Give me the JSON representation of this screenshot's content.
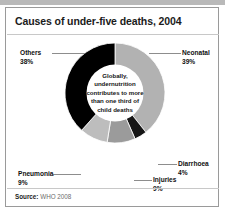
{
  "figure": {
    "title": "Causes of under-five deaths, 2004",
    "center_note": "Globally, undernutrition contributes to more than one third of child deaths",
    "source_label": "Source:",
    "source_value": "WHO 2008"
  },
  "labels": {
    "others": {
      "name": "Others",
      "pct": "38%"
    },
    "neonatal": {
      "name": "Neonatal",
      "pct": "39%"
    },
    "diarrhoea": {
      "name": "Diarrhoea",
      "pct": "4%"
    },
    "injuries": {
      "name": "Injuries",
      "pct": "9%"
    },
    "pneumonia": {
      "name": "Pneumonia",
      "pct": "9%"
    }
  },
  "chart_data": {
    "type": "pie",
    "variant": "donut",
    "title": "Causes of under-five deaths, 2004",
    "categories": [
      "Neonatal",
      "Diarrhoea",
      "Injuries",
      "Pneumonia",
      "Others"
    ],
    "values": [
      39,
      4,
      9,
      9,
      38
    ],
    "value_labels": [
      "39%",
      "4%",
      "9%",
      "9%",
      "38%"
    ],
    "unit": "percent",
    "total": 99,
    "start_angle_deg": 0,
    "direction": "clockwise",
    "inner_radius_ratio": 0.55,
    "colors": [
      "#b2b2b2",
      "#161616",
      "#9b9b9b",
      "#bdbdbd",
      "#000000"
    ],
    "legend": "none",
    "grid": false,
    "annotation": "Globally, undernutrition contributes to more than one third of child deaths",
    "source": "Source: WHO 2008"
  },
  "palette": {
    "neonatal": "#b2b2b2",
    "diarrhoea": "#161616",
    "injuries": "#9b9b9b",
    "pneumonia": "#bdbdbd",
    "others": "#000000",
    "frame_border": "#9a9a9a",
    "top_strip": "#b9b9b9",
    "leader_line": "#8d8d8d",
    "source_text": "#6d6d6d"
  }
}
